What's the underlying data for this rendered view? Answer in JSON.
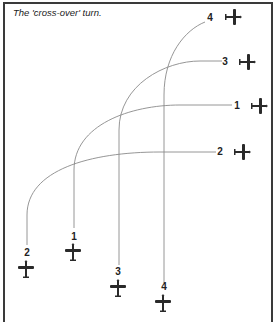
{
  "title": "The 'cross-over' turn.",
  "colors": {
    "line": "#8a8a8a",
    "border": "#3a3a3a",
    "plane": "#2a2a2a",
    "text": "#222222"
  },
  "aircraft": [
    {
      "id": "1",
      "start_label": "1",
      "end_label": "1"
    },
    {
      "id": "2",
      "start_label": "2",
      "end_label": "2"
    },
    {
      "id": "3",
      "start_label": "3",
      "end_label": "3"
    },
    {
      "id": "4",
      "start_label": "4",
      "end_label": "4"
    }
  ],
  "icons": {
    "plane": "aircraft-silhouette-icon"
  }
}
